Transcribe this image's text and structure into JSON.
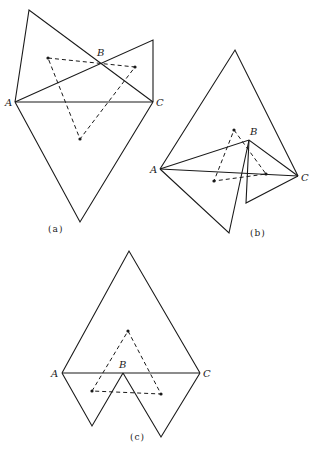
{
  "figures": [
    {
      "id": "a",
      "caption": "(a)",
      "caption_pos": [
        48,
        232
      ],
      "vertices": {
        "A": {
          "label": "A",
          "pos": [
            15,
            102
          ],
          "label_pos": [
            5,
            106
          ]
        },
        "B": {
          "label": "B",
          "pos": [
            100,
            62
          ],
          "label_pos": [
            97,
            56
          ]
        },
        "C": {
          "label": "C",
          "pos": [
            153,
            102
          ],
          "label_pos": [
            156,
            106
          ]
        }
      },
      "polylines": [
        [
          [
            15,
            102
          ],
          [
            29,
            10
          ],
          [
            153,
            102
          ]
        ],
        [
          [
            15,
            102
          ],
          [
            153,
            40
          ],
          [
            153,
            102
          ]
        ],
        [
          [
            15,
            102
          ],
          [
            153,
            102
          ]
        ],
        [
          [
            15,
            102
          ],
          [
            80,
            222
          ],
          [
            153,
            102
          ]
        ]
      ],
      "dashed_triangle": [
        [
          48,
          58
        ],
        [
          135,
          67
        ],
        [
          80,
          139
        ]
      ]
    },
    {
      "id": "b",
      "caption": "(b)",
      "caption_pos": [
        250,
        236
      ],
      "vertices": {
        "A": {
          "label": "A",
          "pos": [
            160,
            169
          ],
          "label_pos": [
            150,
            173
          ]
        },
        "B": {
          "label": "B",
          "pos": [
            249,
            140
          ],
          "label_pos": [
            250,
            135
          ]
        },
        "C": {
          "label": "C",
          "pos": [
            298,
            176
          ],
          "label_pos": [
            301,
            181
          ]
        }
      },
      "polylines": [
        [
          [
            160,
            169
          ],
          [
            235,
            50
          ],
          [
            298,
            176
          ]
        ],
        [
          [
            160,
            169
          ],
          [
            298,
            176
          ]
        ],
        [
          [
            160,
            169
          ],
          [
            249,
            140
          ],
          [
            298,
            176
          ]
        ],
        [
          [
            160,
            169
          ],
          [
            229,
            233
          ],
          [
            249,
            140
          ]
        ],
        [
          [
            249,
            140
          ],
          [
            246,
            203
          ],
          [
            298,
            176
          ]
        ]
      ],
      "dashed_triangle": [
        [
          234,
          130
        ],
        [
          266,
          174
        ],
        [
          214,
          181
        ]
      ]
    },
    {
      "id": "c",
      "caption": "(c)",
      "caption_pos": [
        130,
        440
      ],
      "vertices": {
        "A": {
          "label": "A",
          "pos": [
            62,
            373
          ],
          "label_pos": [
            51,
            377
          ]
        },
        "B": {
          "label": "B",
          "pos": [
            123,
            373
          ],
          "label_pos": [
            119,
            368
          ]
        },
        "C": {
          "label": "C",
          "pos": [
            200,
            373
          ],
          "label_pos": [
            203,
            377
          ]
        }
      },
      "polylines": [
        [
          [
            62,
            373
          ],
          [
            129,
            251
          ],
          [
            200,
            373
          ]
        ],
        [
          [
            62,
            373
          ],
          [
            200,
            373
          ]
        ],
        [
          [
            62,
            373
          ],
          [
            92,
            426
          ],
          [
            123,
            373
          ]
        ],
        [
          [
            123,
            373
          ],
          [
            161,
            437
          ],
          [
            200,
            373
          ]
        ]
      ],
      "dashed_triangle": [
        [
          128,
          331
        ],
        [
          161,
          394
        ],
        [
          92,
          391
        ]
      ]
    }
  ]
}
